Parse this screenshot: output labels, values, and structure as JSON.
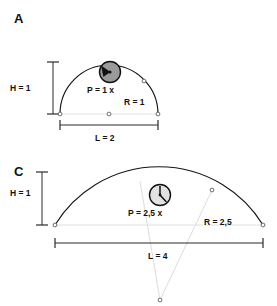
{
  "figure": {
    "title_implicit": "",
    "background_color": "#ffffff",
    "stroke_color": "#151515",
    "faint_color": "#d8d8d8"
  },
  "panels": [
    {
      "id": "A",
      "letter": "A",
      "arch_type": "semicircular",
      "icon": {
        "name": "pressure-gauge-icon",
        "style": "dark-filled",
        "needle": "thick-wedge"
      },
      "labels": {
        "height": "H = 1",
        "span": "L = 2",
        "pressure": "P = 1 x",
        "radius": "R = 1"
      }
    },
    {
      "id": "C",
      "letter": "C",
      "arch_type": "segmental",
      "icon": {
        "name": "pressure-gauge-icon",
        "style": "light-filled",
        "needle": "thin-line"
      },
      "labels": {
        "height": "H = 1",
        "span": "L = 4",
        "pressure": "P = 2,5 x",
        "radius": "R = 2,5"
      }
    }
  ]
}
